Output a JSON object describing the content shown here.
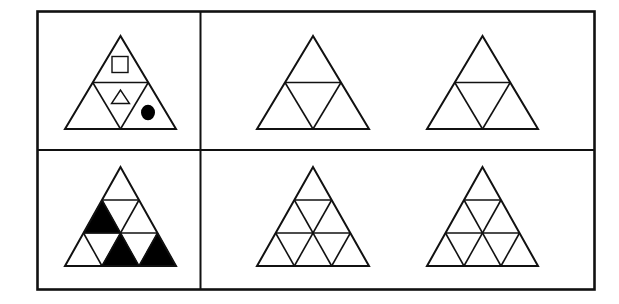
{
  "puzzle": {
    "type": "triangle-pattern-analogy",
    "layout": {
      "rows": 2,
      "example_column": 1,
      "option_columns": 2
    },
    "colors": {
      "stroke": "#111111",
      "fill_black": "#000000",
      "background": "#ffffff"
    },
    "rows": [
      {
        "id": "row-top",
        "example": {
          "subdivisions": 2,
          "contents": [
            {
              "cell": "top",
              "symbol": "square-outline-icon"
            },
            {
              "cell": "center-inverted",
              "symbol": "triangle-outline-icon"
            },
            {
              "cell": "bottom-right",
              "symbol": "filled-circle-icon"
            }
          ]
        },
        "options": [
          {
            "id": "option-top-1",
            "subdivisions": 2,
            "contents": []
          },
          {
            "id": "option-top-2",
            "subdivisions": 2,
            "contents": []
          }
        ]
      },
      {
        "id": "row-bottom",
        "example": {
          "subdivisions": 3,
          "black_cells": [
            "row2-up-left",
            "row3-up-middle",
            "row3-up-right"
          ]
        },
        "options": [
          {
            "id": "option-bottom-1",
            "subdivisions": 3,
            "black_cells": []
          },
          {
            "id": "option-bottom-2",
            "subdivisions": 3,
            "black_cells": []
          }
        ]
      }
    ]
  }
}
